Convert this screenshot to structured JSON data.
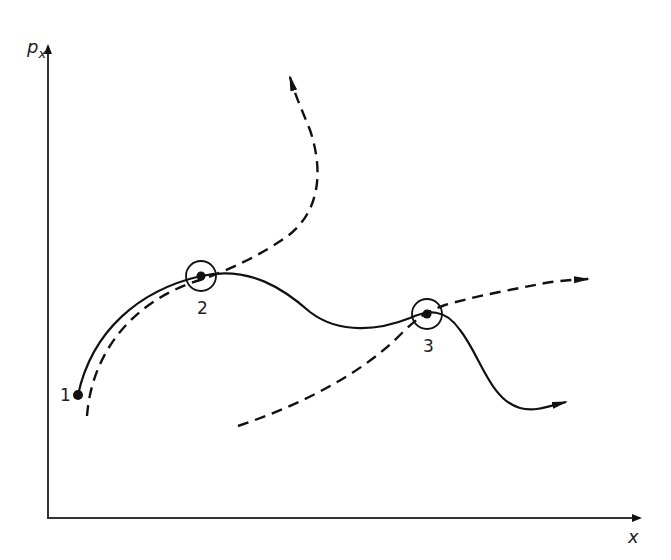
{
  "diagram": {
    "type": "phase-space-trajectories",
    "axes": {
      "y_label": "p",
      "y_label_subscript": "x",
      "x_label": "x"
    },
    "points": [
      {
        "id": "1",
        "label": "1",
        "x": 78,
        "y": 395
      },
      {
        "id": "2",
        "label": "2",
        "x": 201,
        "y": 276
      },
      {
        "id": "3",
        "label": "3",
        "x": 427,
        "y": 314
      }
    ],
    "curves": [
      {
        "name": "solid-trajectory",
        "style": "solid",
        "description": "From point 1 through 2 and 3, ending with arrow at lower right"
      },
      {
        "name": "dashed-trajectory-a",
        "style": "dashed",
        "description": "Parallel to solid from below point 1 through 2, curving up to arrow at top"
      },
      {
        "name": "dashed-trajectory-b",
        "style": "dashed",
        "description": "From lower middle through point 3, continuing right to arrow"
      }
    ],
    "colors": {
      "stroke": "#111111",
      "background": "#ffffff"
    }
  }
}
